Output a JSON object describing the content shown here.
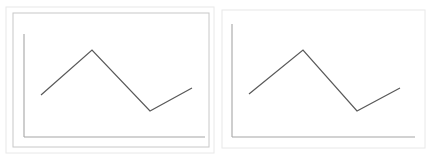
{
  "figure": {
    "background_color": "#ffffff",
    "width": 429,
    "height": 160,
    "panel_count": 2
  },
  "style": {
    "line_color": "#595959",
    "axis_color": "#a6a6a6",
    "frame_outer_color": "#e8e8e8",
    "frame_inner_color": "#c8c8c8",
    "line_width": 1.2,
    "axis_width": 1.1
  },
  "chart_data": [
    {
      "id": "left-chart",
      "type": "line",
      "title": "",
      "subtitle": "",
      "xlabel": "",
      "ylabel": "",
      "grid": false,
      "legend": false,
      "legend_position": "none",
      "axes": {
        "x_axis_visible": true,
        "y_axis_visible": true,
        "top_spine": false,
        "right_spine": false,
        "ticks": false,
        "tick_labels": false
      },
      "xlim": [
        0,
        10
      ],
      "ylim": [
        0,
        10
      ],
      "x": [
        1.0,
        4.2,
        7.4,
        9.4
      ],
      "values": [
        3.2,
        7.9,
        1.8,
        4.1
      ],
      "points_px": [
        {
          "x": 41,
          "y": 95
        },
        {
          "x": 92,
          "y": 50
        },
        {
          "x": 150,
          "y": 111
        },
        {
          "x": 192,
          "y": 88
        }
      ],
      "frame": {
        "outer": {
          "x": 6,
          "y": 7,
          "width": 208,
          "height": 146
        },
        "inner": {
          "x": 13,
          "y": 13,
          "width": 196,
          "height": 134
        }
      },
      "axis_origin_px": {
        "x": 24,
        "y": 137
      },
      "axis_top_px": {
        "x": 24,
        "y": 34
      },
      "axis_right_px": {
        "x": 205,
        "y": 137
      }
    },
    {
      "id": "right-chart",
      "type": "line",
      "title": "",
      "subtitle": "",
      "xlabel": "",
      "ylabel": "",
      "grid": false,
      "legend": false,
      "legend_position": "none",
      "axes": {
        "x_axis_visible": true,
        "y_axis_visible": true,
        "top_spine": false,
        "right_spine": false,
        "ticks": false,
        "tick_labels": false
      },
      "xlim": [
        0,
        10
      ],
      "ylim": [
        0,
        10
      ],
      "x": [
        1.0,
        4.2,
        7.4,
        9.4
      ],
      "values": [
        3.2,
        7.9,
        1.8,
        4.1
      ],
      "points_px": [
        {
          "x": 249,
          "y": 94
        },
        {
          "x": 303,
          "y": 50
        },
        {
          "x": 357,
          "y": 111
        },
        {
          "x": 400,
          "y": 88
        }
      ],
      "frame": {
        "outer": {
          "x": 222,
          "y": 10,
          "width": 203,
          "height": 138
        },
        "inner": null
      },
      "axis_origin_px": {
        "x": 232,
        "y": 137
      },
      "axis_top_px": {
        "x": 232,
        "y": 24
      },
      "axis_right_px": {
        "x": 415,
        "y": 137
      }
    }
  ]
}
